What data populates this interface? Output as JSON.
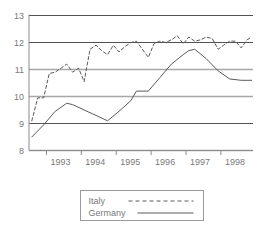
{
  "chart_data": {
    "type": "line",
    "title": "",
    "subtitle": "",
    "xlabel": "",
    "ylabel": "",
    "xlim": [
      1992.5,
      1998.92
    ],
    "ylim": [
      8,
      13
    ],
    "yticks": [
      8,
      9,
      10,
      11,
      12,
      13
    ],
    "ytick_labels": [
      "8",
      "9",
      "10",
      "11",
      "12",
      "13"
    ],
    "xticks": [
      1993,
      1994,
      1995,
      1996,
      1997,
      1998
    ],
    "xtick_labels": [
      "1993",
      "1994",
      "1995",
      "1996",
      "1997",
      "1998"
    ],
    "grid": true,
    "grid_axis": "y",
    "legend_position": "bottom",
    "series": [
      {
        "name": "Italy",
        "style": "dashed",
        "color": "#5a5a5a",
        "x": [
          1992.58,
          1992.75,
          1992.92,
          1993.08,
          1993.25,
          1993.42,
          1993.58,
          1993.75,
          1993.92,
          1994.08,
          1994.25,
          1994.42,
          1994.58,
          1994.75,
          1994.92,
          1995.08,
          1995.25,
          1995.42,
          1995.58,
          1995.75,
          1995.92,
          1996.08,
          1996.25,
          1996.42,
          1996.58,
          1996.75,
          1996.92,
          1997.08,
          1997.25,
          1997.42,
          1997.58,
          1997.75,
          1997.92,
          1998.08,
          1998.25,
          1998.42,
          1998.58,
          1998.75,
          1998.88
        ],
        "y": [
          9.1,
          9.95,
          9.95,
          10.85,
          10.9,
          11.05,
          11.2,
          10.9,
          11.05,
          10.55,
          11.75,
          11.9,
          11.7,
          11.55,
          11.9,
          11.65,
          11.85,
          12.0,
          12.05,
          11.75,
          11.45,
          11.95,
          12.05,
          12.0,
          12.1,
          12.25,
          11.95,
          12.2,
          12.05,
          12.1,
          12.2,
          12.15,
          11.75,
          11.9,
          12.05,
          12.05,
          11.8,
          12.1,
          12.2
        ]
      },
      {
        "name": "Germany",
        "style": "solid",
        "color": "#5a5a5a",
        "x": [
          1992.58,
          1992.92,
          1993.25,
          1993.58,
          1993.75,
          1994.08,
          1994.42,
          1994.75,
          1995.08,
          1995.42,
          1995.58,
          1995.92,
          1996.25,
          1996.58,
          1996.92,
          1997.08,
          1997.25,
          1997.58,
          1997.92,
          1998.25,
          1998.58,
          1998.88
        ],
        "y": [
          8.5,
          8.95,
          9.45,
          9.75,
          9.7,
          9.5,
          9.3,
          9.1,
          9.45,
          9.85,
          10.2,
          10.2,
          10.7,
          11.2,
          11.55,
          11.7,
          11.75,
          11.4,
          10.95,
          10.65,
          10.6,
          10.6
        ]
      }
    ]
  },
  "legend": {
    "items": [
      {
        "label": "Italy",
        "style": "dashed"
      },
      {
        "label": "Germany",
        "style": "solid"
      }
    ]
  },
  "colors": {
    "axis": "#8a8a8a",
    "gridline_dark": "#3f3f3f",
    "gridline_light": "#a8a8a8",
    "series_line": "#5a5a5a",
    "text": "#7a7a7a",
    "legend_border": "#9a9a9a",
    "background": "#ffffff"
  }
}
